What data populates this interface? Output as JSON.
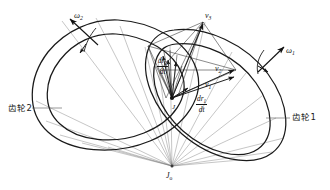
{
  "figure": {
    "background_color": "#ffffff",
    "profile_color": "#1a1a1a",
    "construction_color": "#6b6b6b",
    "vector_color": "#141414"
  },
  "labels": {
    "omega2": {
      "symbol": "ω",
      "sub": "2",
      "x": 74,
      "y": 11
    },
    "omega1": {
      "symbol": "ω",
      "sub": "1",
      "x": 286,
      "y": 46
    },
    "gear2": {
      "text": "齿轮2",
      "x": 8,
      "y": 104
    },
    "gear1": {
      "text": "齿轮1",
      "x": 292,
      "y": 113
    },
    "v1": {
      "symbol": "v",
      "sub": "1",
      "x": 205,
      "y": 81
    },
    "v2": {
      "symbol": "v",
      "sub": "2",
      "x": 215,
      "y": 65
    },
    "v3": {
      "symbol": "v",
      "sub": "3",
      "x": 205,
      "y": 12
    },
    "j": {
      "text": "J",
      "x": 172,
      "y": 104
    },
    "j0": {
      "symbol": "J",
      "sub": "o",
      "x": 166,
      "y": 172
    },
    "dr2dt": {
      "numerator": "dr",
      "numerator_sub": "2",
      "denominator": "dt",
      "x": 157,
      "y": 57
    },
    "dr1dt": {
      "numerator": "dr",
      "numerator_sub": "1",
      "denominator": "dt",
      "x": 196,
      "y": 95
    }
  },
  "chart_data": {
    "type": "diagram",
    "elements": [
      "gear2 outer pitch curve",
      "gear2 inner pitch curve",
      "gear1 outer pitch curve",
      "gear1 inner pitch curve",
      "velocity triangle at contact point",
      "radial construction fan from J_o"
    ]
  }
}
